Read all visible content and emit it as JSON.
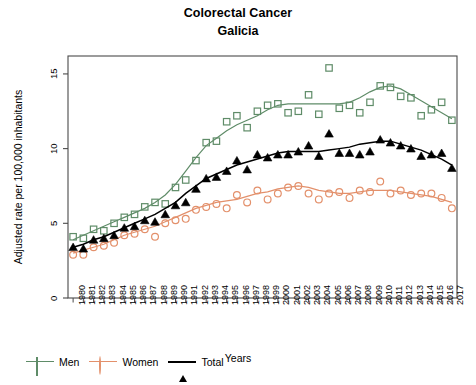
{
  "chart_data": {
    "type": "scatter",
    "title": "Colorectal Cancer",
    "subtitle": "Galicia",
    "xlabel": "Years",
    "ylabel": "Adjusted rate per 100,000 inhabitants",
    "xlim": [
      1979.5,
      2017.5
    ],
    "ylim": [
      0,
      16.2
    ],
    "yticks": [
      0,
      5,
      10,
      15
    ],
    "ytick_labels": [
      "0",
      "5",
      "10",
      "15"
    ],
    "grid": false,
    "legend_position": "below-left",
    "categories": [
      "1980",
      "1981",
      "1982",
      "1983",
      "1984",
      "1985",
      "1986",
      "1987",
      "1988",
      "1989",
      "1990",
      "1991",
      "1992",
      "1993",
      "1994",
      "1995",
      "1996",
      "1997",
      "1998",
      "1999",
      "2000",
      "2001",
      "2002",
      "2003",
      "2004",
      "2005",
      "2006",
      "2007",
      "2008",
      "2009",
      "2010",
      "2011",
      "2012",
      "2013",
      "2014",
      "2015",
      "2016",
      "2017"
    ],
    "series": [
      {
        "name": "Men",
        "color": "#5f8c68",
        "marker": "open-square",
        "has_trend_line": true,
        "values": [
          4.1,
          4.0,
          4.6,
          4.5,
          5.0,
          5.4,
          5.6,
          6.1,
          6.4,
          6.3,
          7.4,
          7.9,
          9.2,
          10.4,
          10.5,
          11.8,
          12.2,
          11.4,
          12.5,
          12.9,
          13.0,
          12.4,
          12.5,
          13.6,
          12.3,
          15.4,
          12.7,
          12.9,
          12.4,
          13.1,
          14.2,
          14.1,
          13.5,
          13.4,
          12.2,
          12.6,
          13.1,
          11.9
        ],
        "trend": [
          3.9,
          4.2,
          4.5,
          4.8,
          5.1,
          5.4,
          5.7,
          6.0,
          6.4,
          6.9,
          7.6,
          8.5,
          9.4,
          10.2,
          10.7,
          11.2,
          11.6,
          11.9,
          12.2,
          12.6,
          12.9,
          13.0,
          13.0,
          13.0,
          13.0,
          13.0,
          13.0,
          13.1,
          13.4,
          13.8,
          14.1,
          14.2,
          14.0,
          13.6,
          13.2,
          12.8,
          12.4,
          12.0
        ]
      },
      {
        "name": "Women",
        "color": "#e3906b",
        "marker": "open-circle",
        "has_trend_line": true,
        "values": [
          2.9,
          2.9,
          3.4,
          3.5,
          3.7,
          4.2,
          4.3,
          4.6,
          4.1,
          5.0,
          5.2,
          5.3,
          5.9,
          6.1,
          6.3,
          6.0,
          6.9,
          6.4,
          7.2,
          6.6,
          7.0,
          7.4,
          7.5,
          7.0,
          6.6,
          7.0,
          7.1,
          6.7,
          7.2,
          7.1,
          7.8,
          7.0,
          7.2,
          6.9,
          7.0,
          7.0,
          6.7,
          6.0
        ],
        "trend": [
          3.0,
          3.2,
          3.4,
          3.6,
          3.9,
          4.2,
          4.4,
          4.6,
          4.8,
          5.1,
          5.4,
          5.7,
          6.0,
          6.2,
          6.4,
          6.5,
          6.6,
          6.8,
          7.0,
          7.1,
          7.3,
          7.4,
          7.5,
          7.4,
          7.2,
          7.1,
          7.0,
          7.0,
          7.1,
          7.2,
          7.2,
          7.2,
          7.1,
          7.0,
          6.9,
          6.8,
          6.6,
          6.4
        ]
      },
      {
        "name": "Total",
        "color": "#000000",
        "marker": "filled-triangle",
        "has_trend_line": true,
        "values": [
          3.4,
          3.3,
          3.9,
          4.0,
          4.2,
          4.7,
          4.8,
          5.2,
          5.1,
          5.6,
          6.2,
          6.4,
          7.3,
          8.0,
          8.1,
          8.5,
          9.2,
          8.6,
          9.6,
          9.4,
          9.6,
          9.6,
          9.8,
          10.2,
          9.5,
          11.0,
          9.7,
          9.7,
          9.6,
          9.8,
          10.6,
          10.4,
          10.2,
          10.0,
          9.5,
          9.6,
          9.7,
          8.7
        ],
        "trend": [
          3.4,
          3.6,
          3.9,
          4.1,
          4.4,
          4.7,
          5.0,
          5.3,
          5.6,
          6.0,
          6.4,
          7.0,
          7.5,
          8.0,
          8.3,
          8.6,
          8.9,
          9.1,
          9.3,
          9.5,
          9.7,
          9.8,
          9.8,
          9.8,
          9.8,
          9.9,
          10.0,
          10.1,
          10.3,
          10.4,
          10.5,
          10.5,
          10.3,
          10.1,
          9.9,
          9.6,
          9.3,
          8.9
        ]
      }
    ]
  },
  "legend": {
    "items": [
      {
        "label": "Men"
      },
      {
        "label": "Women"
      },
      {
        "label": "Total"
      }
    ]
  }
}
